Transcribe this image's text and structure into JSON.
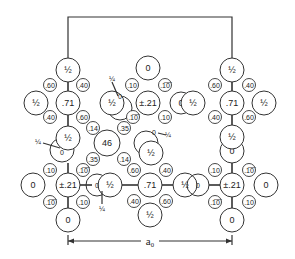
{
  "diagram": {
    "type": "crystal-structure-projection",
    "cell_edge_label": "a₀",
    "box": {
      "left": 68,
      "right": 232,
      "top": 17,
      "bottom_side_stop": 60
    },
    "bonds": [
      [
        68,
        82,
        68,
        91
      ],
      [
        68,
        115,
        68,
        126
      ],
      [
        68,
        163,
        68,
        173
      ],
      [
        68,
        197,
        68,
        208
      ],
      [
        232,
        82,
        232,
        91
      ],
      [
        232,
        115,
        232,
        125
      ],
      [
        232,
        163,
        232,
        173
      ],
      [
        232,
        197,
        232,
        208
      ],
      [
        80,
        185,
        92,
        185
      ],
      [
        122,
        185,
        138,
        185
      ],
      [
        162,
        185,
        173,
        185
      ],
      [
        209,
        185,
        220,
        185
      ]
    ],
    "large_atoms": [
      {
        "id": "a1",
        "x": 68,
        "y": 70,
        "r": 12,
        "label": "½"
      },
      {
        "id": "a2",
        "x": 36,
        "y": 103,
        "r": 12,
        "label": "½"
      },
      {
        "id": "a3",
        "x": 68,
        "y": 103,
        "r": 12,
        "label": ".71"
      },
      {
        "id": "a4",
        "x": 62,
        "y": 150,
        "r": 12,
        "label": "0",
        "open": true
      },
      {
        "id": "a5",
        "x": 68,
        "y": 138,
        "r": 12,
        "label": "½"
      },
      {
        "id": "a6",
        "x": 33,
        "y": 185,
        "r": 12,
        "label": "0"
      },
      {
        "id": "a7",
        "x": 68,
        "y": 185,
        "r": 12,
        "label": "±.21"
      },
      {
        "id": "a8",
        "x": 68,
        "y": 220,
        "r": 12,
        "label": "0"
      },
      {
        "id": "a9",
        "x": 120,
        "y": 108,
        "r": 12,
        "label": "",
        "open": true
      },
      {
        "id": "a10",
        "x": 112,
        "y": 103,
        "r": 12,
        "label": "½"
      },
      {
        "id": "a11",
        "x": 148,
        "y": 68,
        "r": 12,
        "label": "0"
      },
      {
        "id": "a12",
        "x": 148,
        "y": 103,
        "r": 12,
        "label": "±.21"
      },
      {
        "id": "a13",
        "x": 181,
        "y": 103,
        "r": 11,
        "label": "0"
      },
      {
        "id": "a14",
        "x": 193,
        "y": 103,
        "r": 12,
        "label": "½"
      },
      {
        "id": "a15",
        "x": 107,
        "y": 143,
        "r": 13,
        "label": "46"
      },
      {
        "id": "a16",
        "x": 146,
        "y": 143,
        "r": 12,
        "label": "",
        "open": true
      },
      {
        "id": "a17",
        "x": 151,
        "y": 153,
        "r": 12,
        "label": "½"
      },
      {
        "id": "a18",
        "x": 97,
        "y": 185,
        "r": 11,
        "label": "0",
        "open": true
      },
      {
        "id": "a19",
        "x": 110,
        "y": 185,
        "r": 12,
        "label": "½"
      },
      {
        "id": "a20",
        "x": 150,
        "y": 185,
        "r": 12,
        "label": ".71"
      },
      {
        "id": "a21",
        "x": 185,
        "y": 185,
        "r": 12,
        "label": "½"
      },
      {
        "id": "a22",
        "x": 198,
        "y": 185,
        "r": 11,
        "label": "0",
        "open": true
      },
      {
        "id": "a23",
        "x": 150,
        "y": 215,
        "r": 12,
        "label": "½"
      },
      {
        "id": "a24",
        "x": 232,
        "y": 70,
        "r": 12,
        "label": "½"
      },
      {
        "id": "a25",
        "x": 198,
        "y": 103,
        "r": 0,
        "label": ""
      },
      {
        "id": "a26",
        "x": 232,
        "y": 103,
        "r": 12,
        "label": ".71"
      },
      {
        "id": "a27",
        "x": 264,
        "y": 103,
        "r": 12,
        "label": "½"
      },
      {
        "id": "a28",
        "x": 232,
        "y": 151,
        "r": 12,
        "label": "0"
      },
      {
        "id": "a29",
        "x": 232,
        "y": 137,
        "r": 12,
        "label": "½"
      },
      {
        "id": "a30",
        "x": 232,
        "y": 185,
        "r": 12,
        "label": "±.21"
      },
      {
        "id": "a31",
        "x": 266,
        "y": 185,
        "r": 12,
        "label": "0"
      },
      {
        "id": "a32",
        "x": 232,
        "y": 220,
        "r": 12,
        "label": "0"
      }
    ],
    "small_atoms": [
      {
        "x": 50,
        "y": 85,
        "label": ".60"
      },
      {
        "x": 83,
        "y": 85,
        "label": ".40"
      },
      {
        "x": 50,
        "y": 117,
        "label": ".40"
      },
      {
        "x": 83,
        "y": 117,
        "label": ".60"
      },
      {
        "x": 93,
        "y": 128,
        "label": ".14"
      },
      {
        "x": 93,
        "y": 159,
        "label": ".35"
      },
      {
        "x": 50,
        "y": 170,
        "label": ".10"
      },
      {
        "x": 83,
        "y": 170,
        "label": ".1̅0̅"
      },
      {
        "x": 50,
        "y": 202,
        "label": ".1̅0̅"
      },
      {
        "x": 83,
        "y": 202,
        "label": ".10"
      },
      {
        "x": 132,
        "y": 85,
        "label": ".10"
      },
      {
        "x": 165,
        "y": 85,
        "label": ".1̅0̅"
      },
      {
        "x": 133,
        "y": 117,
        "label": ".1̅0̅"
      },
      {
        "x": 165,
        "y": 117,
        "label": ".10"
      },
      {
        "x": 124,
        "y": 128,
        "label": ".35"
      },
      {
        "x": 124,
        "y": 159,
        "label": ".14"
      },
      {
        "x": 134,
        "y": 170,
        "label": ".60"
      },
      {
        "x": 166,
        "y": 170,
        "label": ".40"
      },
      {
        "x": 134,
        "y": 201,
        "label": ".40"
      },
      {
        "x": 166,
        "y": 201,
        "label": ".60"
      },
      {
        "x": 215,
        "y": 85,
        "label": ".60"
      },
      {
        "x": 249,
        "y": 85,
        "label": ".40"
      },
      {
        "x": 215,
        "y": 117,
        "label": ".40"
      },
      {
        "x": 249,
        "y": 117,
        "label": ".60"
      },
      {
        "x": 215,
        "y": 170,
        "label": ".10"
      },
      {
        "x": 249,
        "y": 170,
        "label": ".1̅0̅"
      },
      {
        "x": 215,
        "y": 202,
        "label": ".1̅0̅"
      },
      {
        "x": 249,
        "y": 202,
        "label": ".10"
      }
    ],
    "floating_labels": [
      {
        "x": 120,
        "y": 96,
        "label": "0",
        "size": "s"
      },
      {
        "x": 112,
        "y": 78,
        "label": "¼",
        "size": "s"
      },
      {
        "x": 154,
        "y": 132,
        "label": "0",
        "size": "s"
      },
      {
        "x": 168,
        "y": 134,
        "label": "¼",
        "size": "s"
      },
      {
        "x": 62,
        "y": 152,
        "label": "0",
        "size": "s"
      },
      {
        "x": 38,
        "y": 141,
        "label": "¼",
        "size": "s"
      },
      {
        "x": 102,
        "y": 208,
        "label": "¼",
        "size": "s"
      },
      {
        "x": 97,
        "y": 185,
        "label": "0",
        "size": "s"
      },
      {
        "x": 198,
        "y": 185,
        "label": "0",
        "size": "s"
      }
    ],
    "leaders": [
      [
        112,
        82,
        118,
        96
      ],
      [
        158,
        133,
        166,
        135
      ],
      [
        43,
        143,
        60,
        148
      ],
      [
        102,
        191,
        102,
        204
      ]
    ],
    "arrow": {
      "x1": 68,
      "x2": 232,
      "y": 241,
      "label_x": 150,
      "label": "a₀"
    }
  }
}
